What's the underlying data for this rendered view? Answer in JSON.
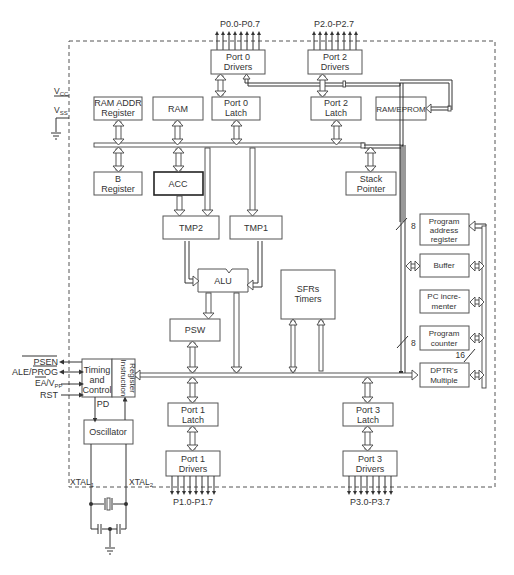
{
  "diagram": {
    "type": "block-diagram",
    "colors": {
      "stroke": "#444444",
      "text": "#333333",
      "background": "#ffffff"
    },
    "pins": {
      "port0": "P0.0-P0.7",
      "port2": "P2.0-P2.7",
      "port1": "P1.0-P1.7",
      "port3": "P3.0-P3.7",
      "vcc": "V",
      "vcc_sub": "CC",
      "vss": "V",
      "vss_sub": "SS",
      "psen": "PSEN",
      "ale": "ALE/PROG",
      "ea": "EA/V",
      "ea_sub": "PP",
      "rst": "RST",
      "xtal1": "XTAL",
      "xtal1_sub": "1",
      "xtal2": "XTAL",
      "xtal2_sub": "2",
      "pd": "PD"
    },
    "blocks": {
      "port0_drivers": [
        "Port 0",
        "Drivers"
      ],
      "port2_drivers": [
        "Port 2",
        "Drivers"
      ],
      "ram_addr_register": [
        "RAM ADDR",
        "Register"
      ],
      "ram": [
        "RAM"
      ],
      "port0_latch": [
        "Port 0",
        "Latch"
      ],
      "port2_latch": [
        "Port 2",
        "Latch"
      ],
      "ram_eprom": [
        "RAM/EPROM"
      ],
      "b_register": [
        "B",
        "Register"
      ],
      "acc": [
        "ACC"
      ],
      "stack_pointer": [
        "Stack",
        "Pointer"
      ],
      "tmp2": [
        "TMP2"
      ],
      "tmp1": [
        "TMP1"
      ],
      "alu": [
        "ALU"
      ],
      "sfrs_timers": [
        "SFRs",
        "Timers"
      ],
      "psw": [
        "PSW"
      ],
      "program_address_register": [
        "Program",
        "address",
        "register"
      ],
      "buffer": [
        "Buffer"
      ],
      "pc_incrementer": [
        "PC incre-",
        "menter"
      ],
      "program_counter": [
        "Program",
        "counter"
      ],
      "dptr_multiple": [
        "DPTR's",
        "Multiple"
      ],
      "timing_control": [
        "Timing",
        "and",
        "Control"
      ],
      "instruction_register": [
        "Instruction",
        "Register"
      ],
      "oscillator": [
        "Oscillator"
      ],
      "port1_latch": [
        "Port 1",
        "Latch"
      ],
      "port3_latch": [
        "Port 3",
        "Latch"
      ],
      "port1_drivers": [
        "Port 1",
        "Drivers"
      ],
      "port3_drivers": [
        "Port 3",
        "Drivers"
      ]
    },
    "bus_widths": {
      "upper_right": "8",
      "lower_mid": "8",
      "address_bus": "16"
    }
  }
}
